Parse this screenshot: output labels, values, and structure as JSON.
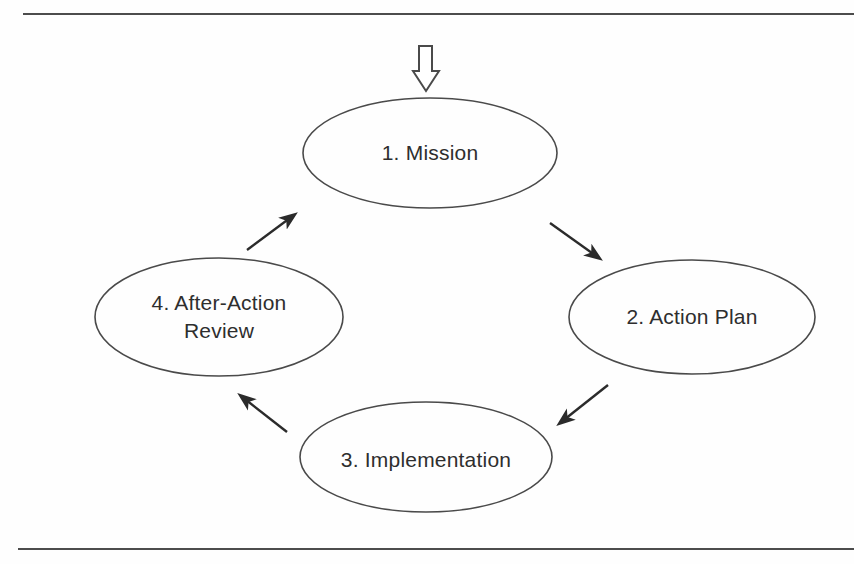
{
  "figure": {
    "type": "cycle-diagram",
    "nodes": [
      {
        "id": "mission",
        "label": "1. Mission"
      },
      {
        "id": "action-plan",
        "label": "2. Action Plan"
      },
      {
        "id": "implementation",
        "label": "3. Implementation"
      },
      {
        "id": "after-action-review",
        "label": "4. After-Action Review",
        "lines": [
          "4. After-Action",
          "Review"
        ]
      }
    ],
    "arrows": [
      {
        "from": "1. Mission",
        "to": "2. Action Plan"
      },
      {
        "from": "2. Action Plan",
        "to": "3. Implementation"
      },
      {
        "from": "3. Implementation",
        "to": "4. After-Action Review"
      },
      {
        "from": "4. After-Action Review",
        "to": "1. Mission"
      }
    ],
    "entry_icon": "hollow-down-arrow",
    "colors": {
      "outline": "#4a4a4a",
      "arrow": "#2b2b2b",
      "text": "#2e2e2e",
      "rule": "#4c4c4c",
      "background": "#fefefe"
    }
  }
}
